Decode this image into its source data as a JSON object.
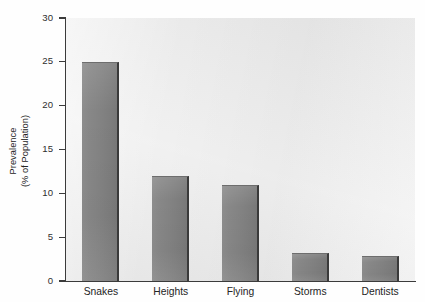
{
  "chart_data": {
    "type": "bar",
    "title": "",
    "subtitle": "",
    "xlabel": "",
    "ylabel_lines": [
      "Prevalence",
      "(% of Population)"
    ],
    "ylabel": "Prevalence (% of Population)",
    "categories": [
      "Snakes",
      "Heights",
      "Flying",
      "Storms",
      "Dentists"
    ],
    "values": [
      25,
      12,
      11,
      3.2,
      2.8
    ],
    "ylim": [
      0,
      30
    ],
    "ytick_values": [
      0,
      5,
      10,
      15,
      20,
      25,
      30
    ],
    "ytick_labels": [
      "0",
      "5",
      "10",
      "15",
      "20",
      "25",
      "30"
    ],
    "grid": false,
    "legend": "none",
    "colors": {
      "bar_fill": "#858585",
      "bar_edge": "#3a3a3a",
      "plot_background": "#e9e9e9",
      "figure_background": "#fefefe",
      "axis": "#3b3b3b",
      "text": "#242424"
    }
  }
}
